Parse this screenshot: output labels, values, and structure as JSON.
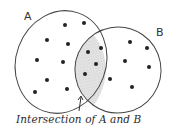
{
  "diagram": {
    "type": "venn",
    "sets": [
      {
        "label": "A",
        "ellipse": {
          "cx": 61,
          "cy": 62,
          "rx": 45,
          "ry": 52,
          "rotate": 20
        }
      },
      {
        "label": "B",
        "ellipse": {
          "cx": 118,
          "cy": 70,
          "rx": 43,
          "ry": 43,
          "rotate": -10
        }
      }
    ],
    "caption": "Intersection of A and B",
    "intersection_shading": "#c8c8c8",
    "stroke_color": "#444444",
    "dot_color": "#222222",
    "points": {
      "A_only": [
        [
          65,
          25
        ],
        [
          84,
          23
        ],
        [
          47,
          40
        ],
        [
          68,
          44
        ],
        [
          37,
          60
        ],
        [
          63,
          62
        ],
        [
          47,
          80
        ],
        [
          35,
          92
        ],
        [
          67,
          89
        ]
      ],
      "intersection": [
        [
          88,
          52
        ],
        [
          101,
          48
        ],
        [
          96,
          64
        ],
        [
          85,
          74
        ]
      ],
      "B_only": [
        [
          130,
          42
        ],
        [
          147,
          48
        ],
        [
          125,
          61
        ],
        [
          149,
          67
        ],
        [
          110,
          79
        ],
        [
          132,
          87
        ]
      ]
    },
    "arrow": {
      "from": [
        79,
        111
      ],
      "to": [
        81,
        97
      ]
    }
  }
}
